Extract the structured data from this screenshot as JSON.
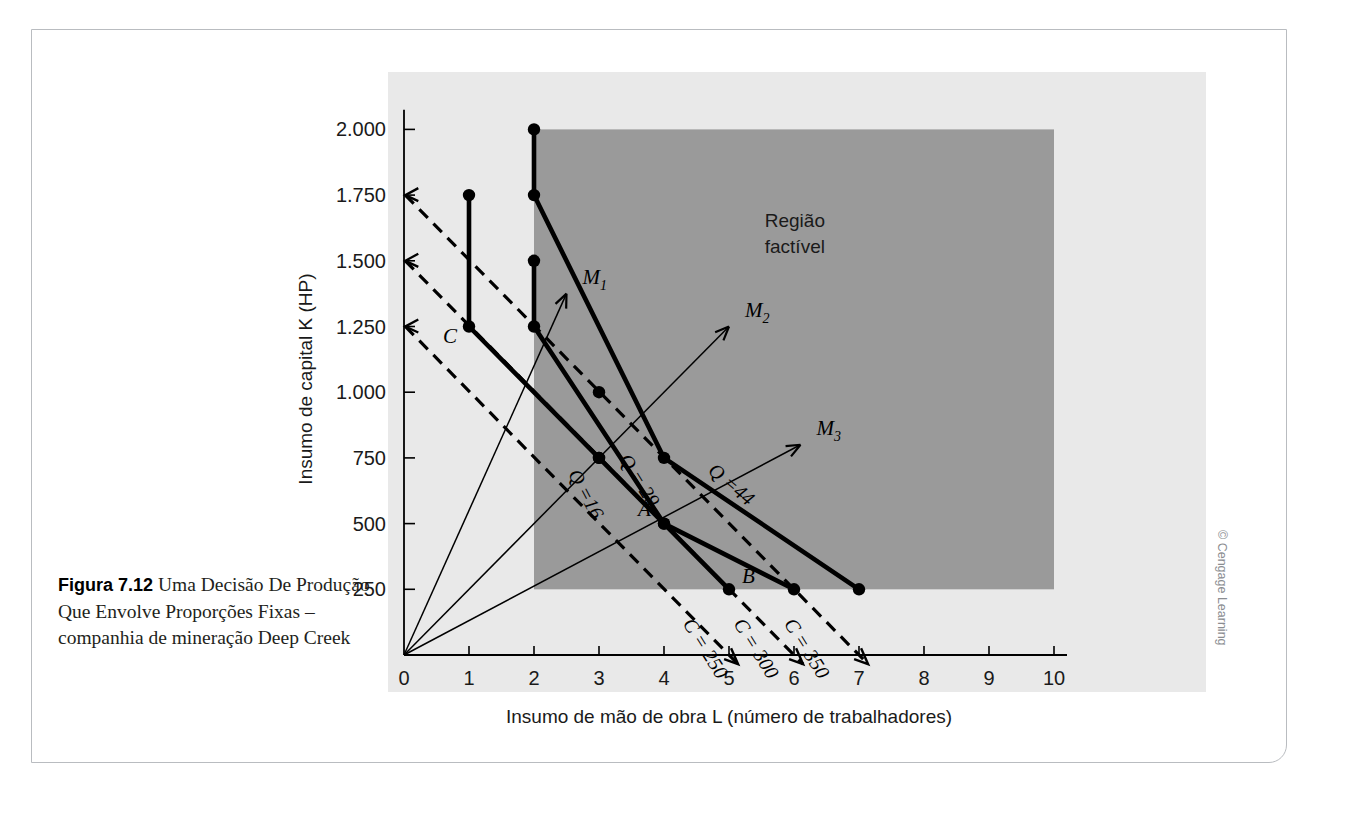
{
  "figure": {
    "number": "Figura 7.12",
    "caption": "Uma Decisão De Produção Que Envolve Proporções Fixas – companhia de mineração Deep Creek",
    "credit": "© Cengage Learning"
  },
  "chart_data": {
    "type": "line",
    "title": "",
    "xlabel": "Insumo de mão de obra L (número de trabalhadores)",
    "ylabel": "Insumo de capital K (HP)",
    "xlim": [
      0,
      10
    ],
    "ylim": [
      0,
      2100
    ],
    "xticks": [
      "0",
      "1",
      "2",
      "3",
      "4",
      "5",
      "6",
      "7",
      "8",
      "9",
      "10"
    ],
    "yticks": [
      "250",
      "500",
      "750",
      "1.000",
      "1.250",
      "1.500",
      "1.750",
      "2.000"
    ],
    "ytick_values": [
      250,
      500,
      750,
      1000,
      1250,
      1500,
      1750,
      2000
    ],
    "grid": false,
    "legend": "none",
    "feasible_region": {
      "label_line1": "Região",
      "label_line2": "factível",
      "x_min": 2,
      "x_max": 10,
      "y_min": 250,
      "y_max": 2000,
      "color": "#9a9a9a"
    },
    "isoquants": [
      {
        "name": "Q = 16",
        "label": "Q =16",
        "points": [
          [
            1,
            1750
          ],
          [
            1,
            1250
          ],
          [
            3,
            750
          ],
          [
            4,
            500
          ],
          [
            5,
            250
          ]
        ],
        "vertices": [
          [
            1,
            1750
          ],
          [
            1,
            1250
          ],
          [
            3,
            750
          ],
          [
            5,
            250
          ]
        ]
      },
      {
        "name": "Q = 29",
        "label": "Q = 29",
        "points": [
          [
            2,
            1500
          ],
          [
            2,
            1250
          ],
          [
            3,
            750
          ],
          [
            4,
            500
          ],
          [
            6,
            250
          ]
        ],
        "vertices": [
          [
            2,
            1500
          ],
          [
            2,
            1250
          ],
          [
            4,
            500
          ],
          [
            6,
            250
          ]
        ]
      },
      {
        "name": "Q = 44",
        "label": "Q =44",
        "points": [
          [
            2,
            2000
          ],
          [
            2,
            1750
          ],
          [
            3,
            1000
          ],
          [
            4,
            750
          ],
          [
            7,
            250
          ]
        ],
        "vertices": [
          [
            2,
            2000
          ],
          [
            2,
            1750
          ],
          [
            4,
            750
          ],
          [
            7,
            250
          ]
        ]
      }
    ],
    "isocosts": [
      {
        "label": "C = 250",
        "x_intercept": 5,
        "y_intercept": 1250
      },
      {
        "label": "C = 300",
        "x_intercept": 6,
        "y_intercept": 1500
      },
      {
        "label": "C = 350",
        "x_intercept": 7,
        "y_intercept": 1750
      }
    ],
    "rays": [
      {
        "label": "M",
        "sub": "1",
        "from": [
          0,
          0
        ],
        "to": [
          2.5,
          1375
        ]
      },
      {
        "label": "M",
        "sub": "2",
        "from": [
          0,
          0
        ],
        "to": [
          5.0,
          1250
        ]
      },
      {
        "label": "M",
        "sub": "3",
        "from": [
          0,
          0
        ],
        "to": [
          6.1,
          800
        ]
      }
    ],
    "labeled_points": [
      {
        "label": "A",
        "x": 4,
        "y": 500
      },
      {
        "label": "B",
        "x": 5,
        "y": 250
      },
      {
        "label": "C",
        "x": 1,
        "y": 1250
      }
    ]
  }
}
